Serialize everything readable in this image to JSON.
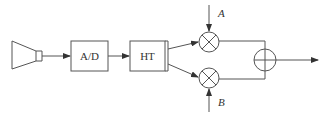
{
  "diagram": {
    "type": "block-diagram",
    "blocks": {
      "source": {
        "name": "horn-antenna",
        "label": ""
      },
      "adc": {
        "label": "A/D"
      },
      "hilbert": {
        "label": "HT"
      },
      "mixer_top": {
        "symbol": "multiplier"
      },
      "mixer_bottom": {
        "symbol": "multiplier"
      },
      "summer": {
        "symbol": "adder"
      }
    },
    "inputs": {
      "top": {
        "label": "A"
      },
      "bottom": {
        "label": "B"
      }
    },
    "colors": {
      "stroke": "#555555",
      "text": "#333333",
      "background": "#ffffff"
    }
  }
}
